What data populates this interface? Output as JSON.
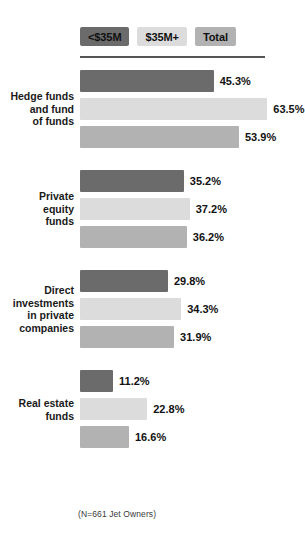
{
  "chart_data": {
    "type": "bar",
    "orientation": "horizontal",
    "title": "",
    "subtitle": "",
    "xlabel": "",
    "ylabel": "",
    "grid": false,
    "legend_position": "top",
    "xlim": [
      0,
      70
    ],
    "value_suffix": "%",
    "categories": [
      "Hedge funds\nand fund\nof funds",
      "Private\nequity\nfunds",
      "Direct\ninvestments\nin private\ncompanies",
      "Real estate\nfunds"
    ],
    "series": [
      {
        "name": "<$35M",
        "color": "#6b6b6b",
        "values": [
          45.3,
          35.2,
          29.8,
          11.2
        ]
      },
      {
        "name": "$35M+",
        "color": "#dcdcdc",
        "values": [
          63.5,
          37.2,
          34.3,
          22.8
        ]
      },
      {
        "name": "Total",
        "color": "#b2b2b2",
        "values": [
          53.9,
          36.2,
          31.9,
          16.6
        ]
      }
    ],
    "annotations": [
      "(N=661 Jet Owners)"
    ]
  },
  "legend": {
    "items": [
      {
        "label": "<$35M",
        "color": "#6b6b6b"
      },
      {
        "label": "$35M+",
        "color": "#dcdcdc"
      },
      {
        "label": "Total",
        "color": "#b2b2b2"
      }
    ]
  },
  "groups": [
    {
      "label_lines": [
        "Hedge funds",
        "and fund",
        "of funds"
      ],
      "bars": [
        {
          "series": "<$35M",
          "value": 45.3,
          "value_label": "45.3%"
        },
        {
          "series": "$35M+",
          "value": 63.5,
          "value_label": "63.5%"
        },
        {
          "series": "Total",
          "value": 53.9,
          "value_label": "53.9%"
        }
      ]
    },
    {
      "label_lines": [
        "Private",
        "equity",
        "funds"
      ],
      "bars": [
        {
          "series": "<$35M",
          "value": 35.2,
          "value_label": "35.2%"
        },
        {
          "series": "$35M+",
          "value": 37.2,
          "value_label": "37.2%"
        },
        {
          "series": "Total",
          "value": 36.2,
          "value_label": "36.2%"
        }
      ]
    },
    {
      "label_lines": [
        "Direct",
        "investments",
        "in private",
        "companies"
      ],
      "bars": [
        {
          "series": "<$35M",
          "value": 29.8,
          "value_label": "29.8%"
        },
        {
          "series": "$35M+",
          "value": 34.3,
          "value_label": "34.3%"
        },
        {
          "series": "Total",
          "value": 31.9,
          "value_label": "31.9%"
        }
      ]
    },
    {
      "label_lines": [
        "Real estate",
        "funds"
      ],
      "bars": [
        {
          "series": "<$35M",
          "value": 11.2,
          "value_label": "11.2%"
        },
        {
          "series": "$35M+",
          "value": 22.8,
          "value_label": "22.8%"
        },
        {
          "series": "Total",
          "value": 16.6,
          "value_label": "16.6%"
        }
      ]
    }
  ],
  "footnote": "(N=661 Jet Owners)",
  "scale": {
    "px_per_percent": 2.95
  }
}
